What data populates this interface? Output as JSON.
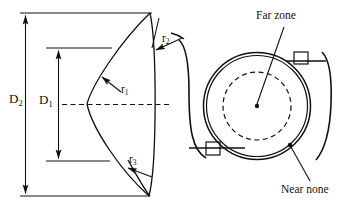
{
  "figure": {
    "background_color": "#ffffff",
    "line_color": "#111111",
    "width": 364,
    "height": 212
  },
  "cross_section": {
    "caption": "Lens cross-section with diameters and radii",
    "dimensions": [
      {
        "key": "D2",
        "base": "D",
        "sub": "2",
        "meaning": "overall lens diameter",
        "position": "outer vertical dimension line, far left"
      },
      {
        "key": "D1",
        "base": "D",
        "sub": "1",
        "meaning": "optic zone diameter",
        "position": "inner vertical dimension line"
      }
    ],
    "radii": [
      {
        "key": "r1",
        "base": "r",
        "sub": "1",
        "meaning": "central posterior radius",
        "leader": "arrow points up-left to front surface"
      },
      {
        "key": "r2",
        "base": "r",
        "sub": "2",
        "meaning": "peripheral radius upper",
        "leader": "arrow points down-left to edge"
      },
      {
        "key": "r3",
        "base": "r",
        "sub": "3",
        "meaning": "peripheral radius lower",
        "leader": "arrow points down-left to edge"
      }
    ],
    "axis": {
      "style": "dashed",
      "meaning": "optical axis centerline"
    }
  },
  "front_view": {
    "caption": "Front view of lens showing zones",
    "annotations": [
      {
        "key": "far_zone",
        "label": "Far zone",
        "target": "center dot inside dashed inner circle"
      },
      {
        "key": "near_zone",
        "label": "Near none",
        "target": "dot between dashed circle and outer rim"
      }
    ],
    "elements": [
      {
        "key": "outer-rim",
        "shape": "double circle",
        "meaning": "lens edge"
      },
      {
        "key": "inner-zone",
        "shape": "dashed circle",
        "meaning": "optic zone boundary"
      },
      {
        "key": "tab-upper-right",
        "shape": "small square",
        "meaning": "stabilization / prism ballast marker"
      },
      {
        "key": "tab-lower-left",
        "shape": "small square",
        "meaning": "stabilization / prism ballast marker"
      },
      {
        "key": "haptic-left",
        "shape": "curve",
        "meaning": "lens haptic outline"
      },
      {
        "key": "haptic-right",
        "shape": "curve",
        "meaning": "lens haptic outline"
      }
    ]
  }
}
